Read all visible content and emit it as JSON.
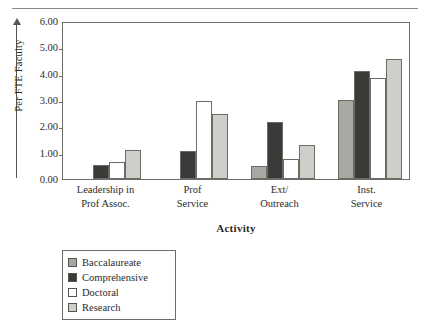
{
  "chart_data": {
    "type": "bar",
    "title": "",
    "xlabel": "Activity",
    "ylabel": "Per FTE Faculty",
    "ylim": [
      0,
      6
    ],
    "yticks": [
      "0.00",
      "1.00",
      "2.00",
      "3.00",
      "4.00",
      "5.00",
      "6.00"
    ],
    "grid": false,
    "legend_position": "below-left",
    "categories": [
      "Leadership in\nProf Assoc.",
      "Prof\nService",
      "Ext/\nOutreach",
      "Inst.\nService"
    ],
    "category_lines": [
      [
        "Leadership in",
        "Prof Assoc."
      ],
      [
        "Prof",
        "Service"
      ],
      [
        "Ext/",
        "Outreach"
      ],
      [
        "Inst.",
        "Service"
      ]
    ],
    "series": [
      {
        "name": "Baccalaureate",
        "color": "#a8a8a3",
        "values": [
          0.0,
          0.0,
          0.5,
          3.0
        ]
      },
      {
        "name": "Comprehensive",
        "color": "#3a3a38",
        "values": [
          0.52,
          1.05,
          2.15,
          4.1
        ]
      },
      {
        "name": "Doctoral",
        "color": "#ffffff",
        "values": [
          0.65,
          2.98,
          0.75,
          3.85
        ]
      },
      {
        "name": "Research",
        "color": "#cfcfca",
        "values": [
          1.12,
          2.48,
          1.3,
          4.55
        ]
      }
    ]
  },
  "legend": {
    "items": [
      {
        "label": "Baccalaureate",
        "color": "#a8a8a3"
      },
      {
        "label": "Comprehensive",
        "color": "#3a3a38"
      },
      {
        "label": "Doctoral",
        "color": "#ffffff"
      },
      {
        "label": "Research",
        "color": "#cfcfca"
      }
    ]
  },
  "axes": {
    "y_title": "Per FTE Faculty",
    "x_title": "Activity",
    "y_ticks": [
      "6.00",
      "5.00",
      "4.00",
      "3.00",
      "2.00",
      "1.00",
      "0.00"
    ]
  }
}
